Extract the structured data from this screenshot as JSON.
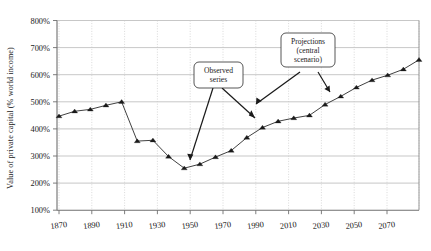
{
  "figure": {
    "background_color": "#ffffff",
    "ink_color": "#1a1a1a",
    "grid_color": "#b9b9b9"
  },
  "axes": {
    "ylabel": "Value of private capital (% world income)",
    "xlabel": ""
  },
  "annotations": {
    "observed": {
      "line1": "Observed",
      "line2": "series"
    },
    "projections": {
      "line1": "Projections",
      "line2": "(central",
      "line3": "scenario)"
    }
  },
  "chart_data": {
    "type": "line",
    "title": "",
    "xlabel": "",
    "ylabel": "Value of private capital (% world income)",
    "xlim": [
      1870,
      2100
    ],
    "ylim": [
      100,
      800
    ],
    "ytick_labels": [
      "100%",
      "200%",
      "300%",
      "400%",
      "500%",
      "600%",
      "700%",
      "800%"
    ],
    "ytick_values": [
      100,
      200,
      300,
      400,
      500,
      600,
      700,
      800
    ],
    "xtick_labels": [
      "1870",
      "1890",
      "1910",
      "1930",
      "1950",
      "1970",
      "1990",
      "2010",
      "2030",
      "2050",
      "2070",
      "2090"
    ],
    "xtick_values": [
      1870,
      1890,
      1910,
      1930,
      1950,
      1970,
      1990,
      2010,
      2030,
      2050,
      2070,
      2090
    ],
    "grid": {
      "horizontal": true,
      "vertical": true,
      "vertical_style": "dotted"
    },
    "legend": null,
    "marker": "triangle",
    "series": [
      {
        "name": "Value of private capital (% world income)",
        "x": [
          1870,
          1880,
          1890,
          1900,
          1910,
          1920,
          1930,
          1940,
          1950,
          1960,
          1970,
          1980,
          1990,
          2000,
          2010,
          2020,
          2030,
          2040,
          2050,
          2060,
          2070,
          2080,
          2090,
          2100
        ],
        "values": [
          447,
          465,
          472,
          487,
          500,
          355,
          358,
          298,
          255,
          270,
          296,
          320,
          368,
          405,
          428,
          440,
          450,
          490,
          520,
          553,
          580,
          598,
          620,
          655
        ]
      }
    ],
    "annotations": [
      {
        "text": "Observed series",
        "points_to_years": [
          1965,
          2005
        ]
      },
      {
        "text": "Projections (central scenario)",
        "points_to_years": [
          2000,
          2035
        ]
      }
    ]
  }
}
